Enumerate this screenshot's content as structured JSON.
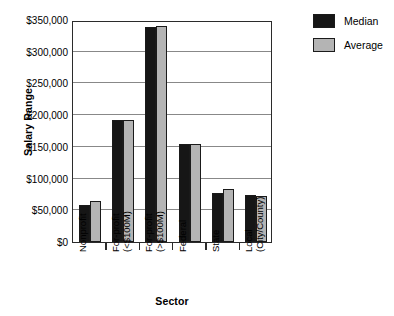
{
  "chart_data": {
    "type": "bar",
    "title": "",
    "xlabel": "Sector",
    "ylabel": "Salary Range",
    "ylim": [
      0,
      350000
    ],
    "grid": true,
    "legend_position": "right",
    "categories": [
      "Nonprofit",
      "For-profit (<$100M)",
      "For-profit (>$100M)",
      "Federal",
      "State",
      "Local (City/County)"
    ],
    "category_lines": [
      [
        "Nonprofit",
        ""
      ],
      [
        "For-profit",
        "(<$100M)"
      ],
      [
        "For-profit",
        "(>$100M)"
      ],
      [
        "Federal",
        ""
      ],
      [
        "State",
        ""
      ],
      [
        "Local",
        "(City/County)"
      ]
    ],
    "series": [
      {
        "name": "Median",
        "color": "#161616",
        "values": [
          58000,
          192000,
          339000,
          155000,
          78000,
          74000
        ]
      },
      {
        "name": "Average",
        "color": "#b4b4b4",
        "values": [
          64000,
          193000,
          340000,
          155000,
          84000,
          73000
        ]
      }
    ],
    "y_ticks": [
      "$0",
      "$50,000",
      "$100,000",
      "$150,000",
      "$200,000",
      "$250,000",
      "$300,000",
      "$350,000"
    ],
    "y_tick_values": [
      0,
      50000,
      100000,
      150000,
      200000,
      250000,
      300000,
      350000
    ]
  },
  "legend": {
    "items": [
      {
        "label": "Median",
        "color": "#161616"
      },
      {
        "label": "Average",
        "color": "#b4b4b4"
      }
    ]
  },
  "axes": {
    "y_title": "Salary Range",
    "x_title": "Sector"
  }
}
